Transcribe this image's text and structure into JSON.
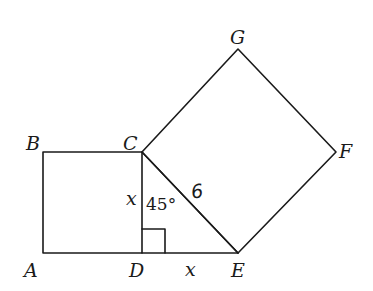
{
  "diagram": {
    "type": "geometry",
    "points": {
      "A": {
        "label": "A",
        "x": 43,
        "y": 253
      },
      "B": {
        "label": "B",
        "x": 43,
        "y": 152
      },
      "C": {
        "label": "C",
        "x": 142,
        "y": 152
      },
      "D": {
        "label": "D",
        "x": 142,
        "y": 253
      },
      "E": {
        "label": "E",
        "x": 238,
        "y": 253
      },
      "F": {
        "label": "F",
        "x": 336,
        "y": 152
      },
      "G": {
        "label": "G",
        "x": 238,
        "y": 49
      }
    },
    "shapes": [
      {
        "name": "square-ABCD",
        "vertices": [
          "A",
          "B",
          "C",
          "D"
        ]
      },
      {
        "name": "triangle-CDE",
        "vertices": [
          "C",
          "D",
          "E"
        ]
      },
      {
        "name": "square-CEFG",
        "vertices": [
          "C",
          "G",
          "F",
          "E"
        ]
      }
    ],
    "annotations": {
      "side_CD": "x",
      "side_DE": "x",
      "hypotenuse_CE": "6",
      "angle_DCE": "45°",
      "right_angle_at": "D"
    }
  }
}
